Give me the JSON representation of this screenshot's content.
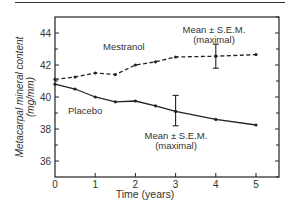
{
  "chart_data": {
    "type": "line",
    "title": "",
    "xlabel": "Time (years)",
    "ylabel_line1": "Metacarpal mineral content",
    "ylabel_line2": "(mg/mm)",
    "xlim": [
      0,
      5.4
    ],
    "ylim": [
      35,
      45
    ],
    "x_ticks": [
      0,
      1,
      2,
      3,
      4,
      5
    ],
    "y_ticks_labeled": [
      36,
      38,
      40,
      42,
      44
    ],
    "y_ticks_minor": [
      35,
      37,
      39,
      41,
      43,
      45
    ],
    "grid": false,
    "legend": "inline labels",
    "series": [
      {
        "name": "Mestranol",
        "style": "dashed",
        "x": [
          0,
          0.5,
          1,
          1.5,
          2,
          2.5,
          3,
          4,
          5
        ],
        "values": [
          41.1,
          41.25,
          41.5,
          41.4,
          42.0,
          42.2,
          42.5,
          42.55,
          42.65
        ],
        "error_bar": {
          "x": 4,
          "low": 41.8,
          "high": 43.3
        }
      },
      {
        "name": "Placebo",
        "style": "solid",
        "x": [
          0,
          0.5,
          1,
          1.5,
          2,
          2.5,
          3,
          4,
          5
        ],
        "values": [
          40.8,
          40.5,
          40.0,
          39.7,
          39.75,
          39.45,
          39.1,
          38.6,
          38.25
        ],
        "error_bar": {
          "x": 3,
          "low": 38.2,
          "high": 40.1
        }
      }
    ],
    "annotations": [
      {
        "text_line1": "Mean ± S.E.M.",
        "text_line2": "(maximal)",
        "near": "Mestranol error bar at 4 years"
      },
      {
        "text_line1": "Mean ± S.E.M.",
        "text_line2": "(maximal)",
        "near": "Placebo error bar at 3 years"
      }
    ]
  },
  "labels": {
    "mestranol": "Mestranol",
    "placebo": "Placebo",
    "anno_top_1": "Mean ± S.E.M.",
    "anno_top_2": "(maximal)",
    "anno_bot_1": "Mean ± S.E.M.",
    "anno_bot_2": "(maximal)",
    "xlabel": "Time (years)",
    "ylabel_1": "Metacarpal mineral content",
    "ylabel_2": "(mg/mm)"
  },
  "colors": {
    "line": "#222222",
    "axis": "#222222"
  }
}
